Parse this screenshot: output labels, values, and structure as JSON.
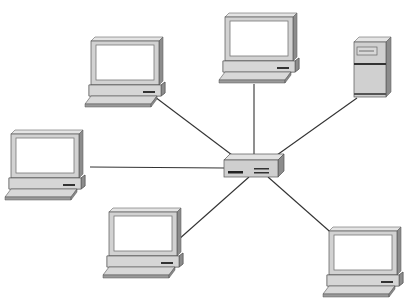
{
  "diagram": {
    "type": "star-network-topology",
    "colors": {
      "background": "#ffffff",
      "line": "#333333",
      "device_body": "#d4d4d4",
      "device_side": "#8a8a8a",
      "device_top": "#e6e6e6",
      "screen": "#ffffff",
      "outline": "#555555"
    },
    "hub": {
      "name": "hub-switch",
      "icon": "network-hub-icon",
      "x": 224,
      "y": 154,
      "w": 60,
      "h": 24
    },
    "nodes": [
      {
        "id": "pc-top-left",
        "icon": "desktop-computer-icon",
        "x": 85,
        "y": 37
      },
      {
        "id": "pc-top-center",
        "icon": "desktop-computer-icon",
        "x": 219,
        "y": 13
      },
      {
        "id": "server-top-right",
        "icon": "server-tower-icon",
        "x": 354,
        "y": 37
      },
      {
        "id": "pc-left",
        "icon": "desktop-computer-icon",
        "x": 5,
        "y": 130
      },
      {
        "id": "pc-bottom-left",
        "icon": "desktop-computer-icon",
        "x": 105,
        "y": 208
      },
      {
        "id": "pc-bottom-right",
        "icon": "desktop-computer-icon",
        "x": 325,
        "y": 227
      }
    ],
    "links": [
      {
        "from": "hub",
        "to": "pc-top-left",
        "x1": 232,
        "y1": 155,
        "x2": 155,
        "y2": 97
      },
      {
        "from": "hub",
        "to": "pc-top-center",
        "x1": 254,
        "y1": 154,
        "x2": 254,
        "y2": 84
      },
      {
        "from": "hub",
        "to": "server-top-right",
        "x1": 277,
        "y1": 155,
        "x2": 357,
        "y2": 98
      },
      {
        "from": "hub",
        "to": "pc-left",
        "x1": 224,
        "y1": 168,
        "x2": 90,
        "y2": 167
      },
      {
        "from": "hub",
        "to": "pc-bottom-left",
        "x1": 249,
        "y1": 177,
        "x2": 178,
        "y2": 240
      },
      {
        "from": "hub",
        "to": "pc-bottom-right",
        "x1": 268,
        "y1": 177,
        "x2": 336,
        "y2": 237
      }
    ]
  }
}
